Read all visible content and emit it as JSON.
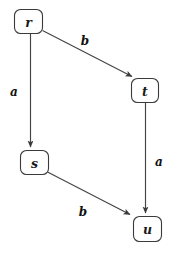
{
  "diagram": {
    "type": "state-transition-diagram",
    "title": "",
    "background_color": "#ffffff",
    "node_stroke_color": "#3a3a3a",
    "edge_color": "#444444",
    "text_color": "#1a1a1a",
    "nodes": [
      {
        "id": "r",
        "label": "r",
        "x": 28,
        "y": 21,
        "w": 28,
        "h": 24
      },
      {
        "id": "t",
        "label": "t",
        "x": 145,
        "y": 90,
        "w": 27,
        "h": 24
      },
      {
        "id": "s",
        "label": "s",
        "x": 34,
        "y": 162,
        "w": 28,
        "h": 24
      },
      {
        "id": "u",
        "label": "u",
        "x": 147,
        "y": 228,
        "w": 28,
        "h": 25
      }
    ],
    "edges": [
      {
        "from": "r",
        "to": "t",
        "label": "b",
        "label_x": 85,
        "label_y": 41
      },
      {
        "from": "r",
        "to": "s",
        "label": "a",
        "label_x": 14,
        "label_y": 92
      },
      {
        "from": "t",
        "to": "u",
        "label": "a",
        "label_x": 159,
        "label_y": 162
      },
      {
        "from": "s",
        "to": "u",
        "label": "b",
        "label_x": 83,
        "label_y": 212
      }
    ]
  }
}
